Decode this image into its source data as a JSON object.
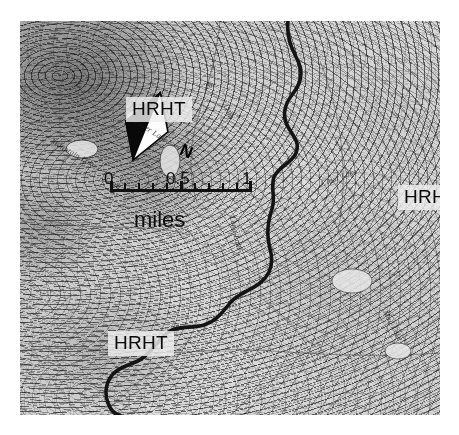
{
  "map": {
    "type": "topographic-quadrangle",
    "rendering": "grayscale shaded relief with contour lines",
    "margin_color": "#ffffff",
    "region_labels": [
      {
        "text": "HRHT",
        "position": "upper-left-center"
      },
      {
        "text": "HRHT",
        "position": "right-center"
      },
      {
        "text": "HRHT",
        "position": "lower-left"
      }
    ],
    "place_labels": [
      {
        "text": "Beaver Lake",
        "position": "upper-left-center"
      },
      {
        "text": "Mountain Lake",
        "position": "left"
      },
      {
        "text": "Long Lake",
        "position": "center"
      },
      {
        "text": "Clear Lake",
        "position": "right-center"
      },
      {
        "text": "Mud Lake",
        "position": "lower-right"
      }
    ],
    "contour_labels": [
      "28",
      "26",
      "1100",
      "1200"
    ],
    "features": {
      "boundary_line": "thick dark sinuous river / county boundary running north to south through the center-right",
      "grid_lines": "thin diagonal survey grid lines oriented northeast to southwest",
      "terrain_high_relief": "upper-left quadrant, dense dark closely-spaced contours",
      "terrain_low_relief": "lower-right quadrant, sparse light contours"
    }
  },
  "scalebar": {
    "ticks": [
      "0",
      "0.5",
      "1"
    ],
    "units": "miles",
    "minor_divisions": 10
  },
  "north_arrow": {
    "letter": "N",
    "style": "two-tone black and white compass needle",
    "bearing_note": "rotated clockwise from vertical"
  },
  "colors": {
    "ink": "#111111",
    "paper": "#d8d8d8",
    "label_background": "#eeeeee",
    "boundary": "#151515"
  }
}
